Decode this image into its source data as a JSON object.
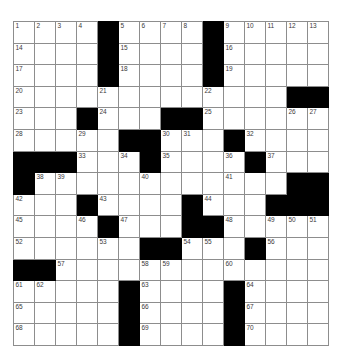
{
  "puzzle": {
    "title": "Crossword Grid",
    "type": "crossword-grid",
    "rows": 15,
    "cols": 15,
    "cell_size_px": 21,
    "colors": {
      "block": "#000000",
      "cell": "#ffffff",
      "gridline": "#8d8d8d",
      "number_text": "#3a3a3a",
      "page_background": "#ffffff"
    },
    "counts": {
      "total_cells": 225,
      "block_cells": 57,
      "open_cells": 168,
      "highest_clue_number": 70
    },
    "grid": [
      [
        {
          "block": false,
          "num": "1"
        },
        {
          "block": false,
          "num": "2"
        },
        {
          "block": false,
          "num": "3"
        },
        {
          "block": false,
          "num": "4"
        },
        {
          "block": true,
          "num": ""
        },
        {
          "block": false,
          "num": "5"
        },
        {
          "block": false,
          "num": "6"
        },
        {
          "block": false,
          "num": "7"
        },
        {
          "block": false,
          "num": "8"
        },
        {
          "block": true,
          "num": ""
        },
        {
          "block": false,
          "num": "9"
        },
        {
          "block": false,
          "num": "10"
        },
        {
          "block": false,
          "num": "11"
        },
        {
          "block": false,
          "num": "12"
        },
        {
          "block": false,
          "num": "13"
        }
      ],
      [
        {
          "block": false,
          "num": "14"
        },
        {
          "block": false,
          "num": ""
        },
        {
          "block": false,
          "num": ""
        },
        {
          "block": false,
          "num": ""
        },
        {
          "block": true,
          "num": ""
        },
        {
          "block": false,
          "num": "15"
        },
        {
          "block": false,
          "num": ""
        },
        {
          "block": false,
          "num": ""
        },
        {
          "block": false,
          "num": ""
        },
        {
          "block": true,
          "num": ""
        },
        {
          "block": false,
          "num": "16"
        },
        {
          "block": false,
          "num": ""
        },
        {
          "block": false,
          "num": ""
        },
        {
          "block": false,
          "num": ""
        },
        {
          "block": false,
          "num": ""
        }
      ],
      [
        {
          "block": false,
          "num": "17"
        },
        {
          "block": false,
          "num": ""
        },
        {
          "block": false,
          "num": ""
        },
        {
          "block": false,
          "num": ""
        },
        {
          "block": true,
          "num": ""
        },
        {
          "block": false,
          "num": "18"
        },
        {
          "block": false,
          "num": ""
        },
        {
          "block": false,
          "num": ""
        },
        {
          "block": false,
          "num": ""
        },
        {
          "block": true,
          "num": ""
        },
        {
          "block": false,
          "num": "19"
        },
        {
          "block": false,
          "num": ""
        },
        {
          "block": false,
          "num": ""
        },
        {
          "block": false,
          "num": ""
        },
        {
          "block": false,
          "num": ""
        }
      ],
      [
        {
          "block": false,
          "num": "20"
        },
        {
          "block": false,
          "num": ""
        },
        {
          "block": false,
          "num": ""
        },
        {
          "block": false,
          "num": ""
        },
        {
          "block": false,
          "num": "21"
        },
        {
          "block": false,
          "num": ""
        },
        {
          "block": false,
          "num": ""
        },
        {
          "block": false,
          "num": ""
        },
        {
          "block": false,
          "num": ""
        },
        {
          "block": false,
          "num": "22"
        },
        {
          "block": false,
          "num": ""
        },
        {
          "block": false,
          "num": ""
        },
        {
          "block": false,
          "num": ""
        },
        {
          "block": true,
          "num": ""
        },
        {
          "block": true,
          "num": ""
        }
      ],
      [
        {
          "block": false,
          "num": "23"
        },
        {
          "block": false,
          "num": ""
        },
        {
          "block": false,
          "num": ""
        },
        {
          "block": true,
          "num": ""
        },
        {
          "block": false,
          "num": "24"
        },
        {
          "block": false,
          "num": ""
        },
        {
          "block": false,
          "num": ""
        },
        {
          "block": true,
          "num": ""
        },
        {
          "block": true,
          "num": ""
        },
        {
          "block": false,
          "num": "25"
        },
        {
          "block": false,
          "num": ""
        },
        {
          "block": false,
          "num": ""
        },
        {
          "block": false,
          "num": ""
        },
        {
          "block": false,
          "num": "26"
        },
        {
          "block": false,
          "num": "27"
        }
      ],
      [
        {
          "block": false,
          "num": "28"
        },
        {
          "block": false,
          "num": ""
        },
        {
          "block": false,
          "num": ""
        },
        {
          "block": false,
          "num": "29"
        },
        {
          "block": false,
          "num": ""
        },
        {
          "block": true,
          "num": ""
        },
        {
          "block": true,
          "num": ""
        },
        {
          "block": false,
          "num": "30"
        },
        {
          "block": false,
          "num": "31"
        },
        {
          "block": false,
          "num": ""
        },
        {
          "block": true,
          "num": ""
        },
        {
          "block": false,
          "num": "32"
        },
        {
          "block": false,
          "num": ""
        },
        {
          "block": false,
          "num": ""
        },
        {
          "block": false,
          "num": ""
        }
      ],
      [
        {
          "block": true,
          "num": ""
        },
        {
          "block": true,
          "num": ""
        },
        {
          "block": true,
          "num": ""
        },
        {
          "block": false,
          "num": "33"
        },
        {
          "block": false,
          "num": ""
        },
        {
          "block": false,
          "num": "34"
        },
        {
          "block": true,
          "num": ""
        },
        {
          "block": false,
          "num": "35"
        },
        {
          "block": false,
          "num": ""
        },
        {
          "block": false,
          "num": ""
        },
        {
          "block": false,
          "num": "36"
        },
        {
          "block": true,
          "num": ""
        },
        {
          "block": false,
          "num": "37"
        },
        {
          "block": false,
          "num": ""
        },
        {
          "block": false,
          "num": ""
        }
      ],
      [
        {
          "block": true,
          "num": ""
        },
        {
          "block": false,
          "num": "38"
        },
        {
          "block": false,
          "num": "39"
        },
        {
          "block": false,
          "num": ""
        },
        {
          "block": false,
          "num": ""
        },
        {
          "block": false,
          "num": ""
        },
        {
          "block": false,
          "num": "40"
        },
        {
          "block": false,
          "num": ""
        },
        {
          "block": false,
          "num": ""
        },
        {
          "block": false,
          "num": ""
        },
        {
          "block": false,
          "num": "41"
        },
        {
          "block": false,
          "num": ""
        },
        {
          "block": false,
          "num": ""
        },
        {
          "block": true,
          "num": ""
        },
        {
          "block": true,
          "num": ""
        }
      ],
      [
        {
          "block": false,
          "num": "42"
        },
        {
          "block": false,
          "num": ""
        },
        {
          "block": false,
          "num": ""
        },
        {
          "block": true,
          "num": ""
        },
        {
          "block": false,
          "num": "43"
        },
        {
          "block": false,
          "num": ""
        },
        {
          "block": false,
          "num": ""
        },
        {
          "block": false,
          "num": ""
        },
        {
          "block": true,
          "num": ""
        },
        {
          "block": false,
          "num": "44"
        },
        {
          "block": false,
          "num": ""
        },
        {
          "block": false,
          "num": ""
        },
        {
          "block": true,
          "num": ""
        },
        {
          "block": true,
          "num": ""
        },
        {
          "block": true,
          "num": ""
        }
      ],
      [
        {
          "block": false,
          "num": "45"
        },
        {
          "block": false,
          "num": ""
        },
        {
          "block": false,
          "num": ""
        },
        {
          "block": false,
          "num": "46"
        },
        {
          "block": true,
          "num": ""
        },
        {
          "block": false,
          "num": "47"
        },
        {
          "block": false,
          "num": ""
        },
        {
          "block": false,
          "num": ""
        },
        {
          "block": true,
          "num": ""
        },
        {
          "block": true,
          "num": ""
        },
        {
          "block": false,
          "num": "48"
        },
        {
          "block": false,
          "num": ""
        },
        {
          "block": false,
          "num": "49"
        },
        {
          "block": false,
          "num": "50"
        },
        {
          "block": false,
          "num": "51"
        }
      ],
      [
        {
          "block": false,
          "num": "52"
        },
        {
          "block": false,
          "num": ""
        },
        {
          "block": false,
          "num": ""
        },
        {
          "block": false,
          "num": ""
        },
        {
          "block": false,
          "num": "53"
        },
        {
          "block": false,
          "num": ""
        },
        {
          "block": true,
          "num": ""
        },
        {
          "block": true,
          "num": ""
        },
        {
          "block": false,
          "num": "54"
        },
        {
          "block": false,
          "num": "55"
        },
        {
          "block": false,
          "num": ""
        },
        {
          "block": true,
          "num": ""
        },
        {
          "block": false,
          "num": "56"
        },
        {
          "block": false,
          "num": ""
        },
        {
          "block": false,
          "num": ""
        }
      ],
      [
        {
          "block": true,
          "num": ""
        },
        {
          "block": true,
          "num": ""
        },
        {
          "block": false,
          "num": "57"
        },
        {
          "block": false,
          "num": ""
        },
        {
          "block": false,
          "num": ""
        },
        {
          "block": false,
          "num": ""
        },
        {
          "block": false,
          "num": "58"
        },
        {
          "block": false,
          "num": "59"
        },
        {
          "block": false,
          "num": ""
        },
        {
          "block": false,
          "num": ""
        },
        {
          "block": false,
          "num": "60"
        },
        {
          "block": false,
          "num": ""
        },
        {
          "block": false,
          "num": ""
        },
        {
          "block": false,
          "num": ""
        },
        {
          "block": false,
          "num": ""
        }
      ],
      [
        {
          "block": false,
          "num": "61"
        },
        {
          "block": false,
          "num": "62"
        },
        {
          "block": false,
          "num": ""
        },
        {
          "block": false,
          "num": ""
        },
        {
          "block": false,
          "num": ""
        },
        {
          "block": true,
          "num": ""
        },
        {
          "block": false,
          "num": "63"
        },
        {
          "block": false,
          "num": ""
        },
        {
          "block": false,
          "num": ""
        },
        {
          "block": false,
          "num": ""
        },
        {
          "block": true,
          "num": ""
        },
        {
          "block": false,
          "num": "64"
        },
        {
          "block": false,
          "num": ""
        },
        {
          "block": false,
          "num": ""
        },
        {
          "block": false,
          "num": ""
        }
      ],
      [
        {
          "block": false,
          "num": "65"
        },
        {
          "block": false,
          "num": ""
        },
        {
          "block": false,
          "num": ""
        },
        {
          "block": false,
          "num": ""
        },
        {
          "block": false,
          "num": ""
        },
        {
          "block": true,
          "num": ""
        },
        {
          "block": false,
          "num": "66"
        },
        {
          "block": false,
          "num": ""
        },
        {
          "block": false,
          "num": ""
        },
        {
          "block": false,
          "num": ""
        },
        {
          "block": true,
          "num": ""
        },
        {
          "block": false,
          "num": "67"
        },
        {
          "block": false,
          "num": ""
        },
        {
          "block": false,
          "num": ""
        },
        {
          "block": false,
          "num": ""
        }
      ],
      [
        {
          "block": false,
          "num": "68"
        },
        {
          "block": false,
          "num": ""
        },
        {
          "block": false,
          "num": ""
        },
        {
          "block": false,
          "num": ""
        },
        {
          "block": false,
          "num": ""
        },
        {
          "block": true,
          "num": ""
        },
        {
          "block": false,
          "num": "69"
        },
        {
          "block": false,
          "num": ""
        },
        {
          "block": false,
          "num": ""
        },
        {
          "block": false,
          "num": ""
        },
        {
          "block": true,
          "num": ""
        },
        {
          "block": false,
          "num": "70"
        },
        {
          "block": false,
          "num": ""
        },
        {
          "block": false,
          "num": ""
        },
        {
          "block": false,
          "num": ""
        }
      ]
    ]
  }
}
